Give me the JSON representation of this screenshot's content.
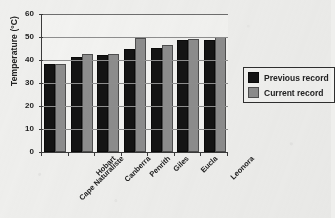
{
  "chart_data": {
    "type": "bar",
    "title": "",
    "xlabel": "",
    "ylabel": "Temperature (°C)",
    "ylim": [
      0,
      60
    ],
    "ytick_values": [
      60,
      50,
      40,
      30,
      20,
      10,
      0
    ],
    "ytick_labels": [
      "60",
      "50",
      "40",
      "30",
      "20",
      "10",
      "0"
    ],
    "grid": true,
    "grid_axis": "y",
    "legend_position": "right",
    "categories": [
      "Cape Naturaliste",
      "Hobart",
      "Canberra",
      "Penrith",
      "Giles",
      "Eucla",
      "Leonora"
    ],
    "series": [
      {
        "name": "Previous record",
        "color": "#141414",
        "values": [
          37.3,
          40.5,
          41.2,
          43.9,
          44.2,
          47.8,
          47.8
        ]
      },
      {
        "name": "Current record",
        "color": "#8d8d8d",
        "values": [
          37.5,
          41.7,
          41.9,
          48.6,
          45.6,
          48.3,
          49.0
        ]
      }
    ]
  },
  "legend": {
    "items": [
      {
        "label": "Previous record",
        "swatch": "black-square-swatch"
      },
      {
        "label": "Current record",
        "swatch": "gray-square-swatch"
      }
    ]
  }
}
